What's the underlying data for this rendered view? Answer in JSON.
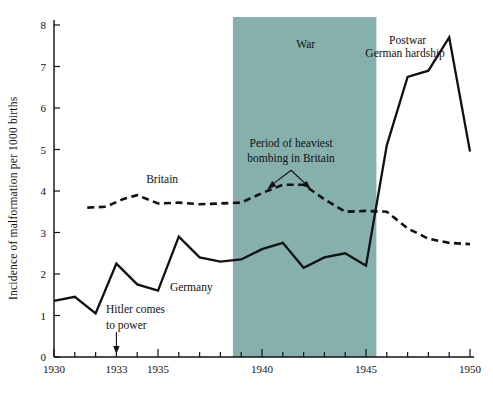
{
  "chart_data": {
    "type": "line",
    "title": "",
    "xlabel": "",
    "ylabel": "Incidence of malformation per 1000 births",
    "xlim": [
      1930,
      1950
    ],
    "ylim": [
      0,
      8
    ],
    "grid": false,
    "legend_position": "inline-labels",
    "x_ticks": [
      1930,
      1931,
      1932,
      1933,
      1934,
      1935,
      1936,
      1937,
      1938,
      1939,
      1940,
      1941,
      1942,
      1943,
      1944,
      1945,
      1946,
      1947,
      1948,
      1949,
      1950
    ],
    "x_tick_labels": [
      "1930",
      "",
      "",
      "1933",
      "",
      "1935",
      "",
      "",
      "",
      "",
      "1940",
      "",
      "",
      "",
      "",
      "1945",
      "",
      "",
      "",
      "",
      "1950"
    ],
    "y_ticks": [
      0,
      1,
      2,
      3,
      4,
      5,
      6,
      7,
      8
    ],
    "y_tick_labels": [
      "0",
      "1",
      "2",
      "3",
      "4",
      "5",
      "6",
      "7",
      "8"
    ],
    "series": [
      {
        "name": "Germany",
        "style": "solid",
        "color": "#111111",
        "x": [
          1930,
          1931,
          1932,
          1933,
          1934,
          1935,
          1936,
          1937,
          1938,
          1939,
          1940,
          1941,
          1942,
          1943,
          1944,
          1945,
          1946,
          1947,
          1948,
          1949,
          1950
        ],
        "values": [
          1.35,
          1.45,
          1.05,
          2.25,
          1.75,
          1.6,
          2.9,
          2.4,
          2.3,
          2.35,
          2.6,
          2.75,
          2.15,
          2.4,
          2.5,
          2.2,
          5.1,
          6.75,
          6.9,
          7.7,
          4.95
        ]
      },
      {
        "name": "Britain",
        "style": "dashed",
        "color": "#111111",
        "x": [
          1931.6,
          1932.5,
          1933.3,
          1934,
          1935,
          1936,
          1937,
          1938,
          1939,
          1940,
          1941,
          1942,
          1943,
          1944,
          1945,
          1946,
          1947,
          1948,
          1949,
          1950
        ],
        "values": [
          3.6,
          3.62,
          3.8,
          3.9,
          3.7,
          3.72,
          3.68,
          3.7,
          3.72,
          3.95,
          4.15,
          4.15,
          3.8,
          3.5,
          3.52,
          3.5,
          3.1,
          2.85,
          2.75,
          2.72
        ]
      }
    ],
    "shaded_regions": [
      {
        "label": "War",
        "x_start": 1938.6,
        "x_end": 1945.5,
        "color": "#85B0AC"
      }
    ],
    "annotations": [
      {
        "id": "war",
        "text": "War",
        "x": 1942.1,
        "y": 7.45
      },
      {
        "id": "postwar",
        "line1": "Postwar",
        "line2": "German hardship",
        "x": 1947.0,
        "y": 7.55
      },
      {
        "id": "bombing",
        "line1": "Period of heaviest",
        "line2": "bombing in Britain",
        "x": 1941.4,
        "y": 5.05
      },
      {
        "id": "hitler",
        "line1": "Hitler comes",
        "line2": "to power",
        "x": 1933.0,
        "y": 1.05
      },
      {
        "id": "britain-label",
        "text": "Britain",
        "x": 1935.2,
        "y": 4.2
      },
      {
        "id": "germany-label",
        "text": "Germany",
        "x": 1936.6,
        "y": 1.6
      }
    ]
  },
  "colors": {
    "war_band": "#85B0AC",
    "ink": "#111111",
    "page": "#ffffff"
  }
}
